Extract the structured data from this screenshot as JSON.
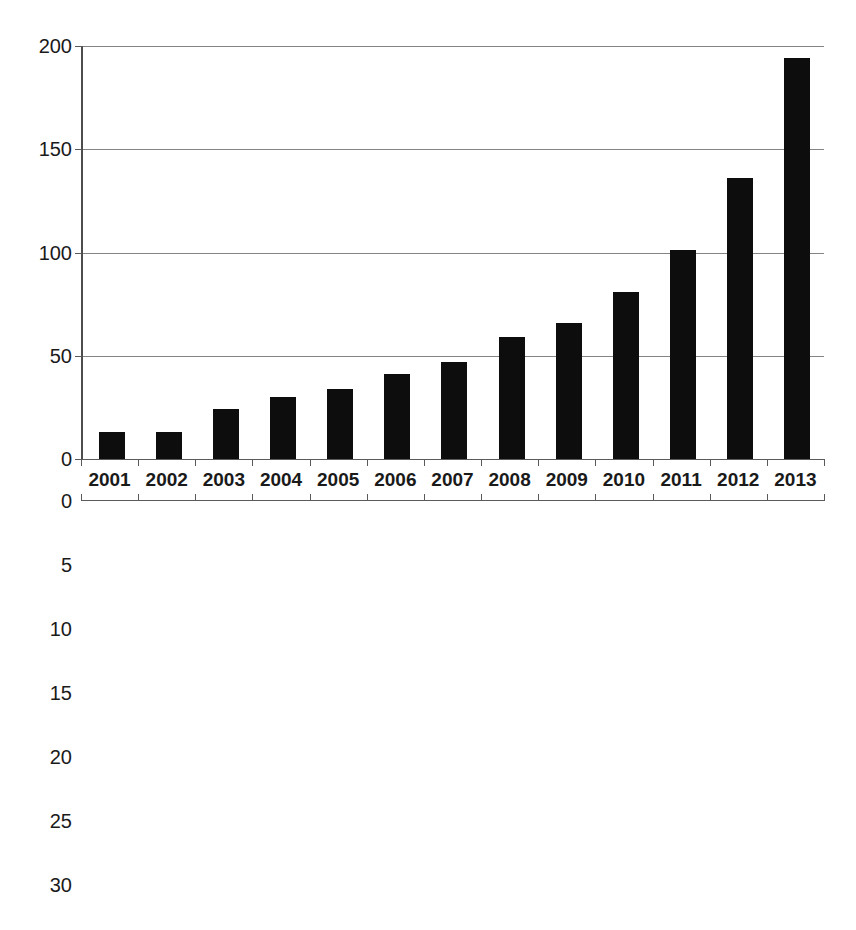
{
  "chart_data": [
    {
      "id": "top",
      "type": "bar",
      "title": "",
      "xlabel": "",
      "ylabel": "",
      "orientation": "up",
      "grid": true,
      "legend": "none",
      "categories": [
        "2001",
        "2002",
        "2003",
        "2004",
        "2005",
        "2006",
        "2007",
        "2008",
        "2009",
        "2010",
        "2011",
        "2012",
        "2013"
      ],
      "values": [
        13,
        13,
        24,
        30,
        34,
        41,
        47,
        59,
        66,
        81,
        101,
        136,
        194
      ],
      "ylim": [
        0,
        200
      ],
      "yticks": [
        0,
        50,
        100,
        150,
        200
      ],
      "ytick_labels": [
        "0",
        "50",
        "100",
        "150",
        "200"
      ],
      "bar_color": "#0d0d0d",
      "series_name": ""
    },
    {
      "id": "bottom",
      "type": "bar",
      "title": "",
      "xlabel": "",
      "ylabel": "",
      "orientation": "down",
      "grid": true,
      "legend": "none",
      "categories": [
        "2001",
        "2002",
        "2003",
        "2004",
        "2005",
        "2006",
        "2007",
        "2008",
        "2009",
        "2010",
        "2011",
        "2012",
        "2013"
      ],
      "values": [
        6,
        6,
        12,
        15,
        16,
        16,
        16,
        18,
        18,
        20,
        22,
        24,
        30
      ],
      "ylim": [
        0,
        30
      ],
      "yticks": [
        0,
        5,
        10,
        15,
        20,
        25,
        30
      ],
      "ytick_labels": [
        "0",
        "5",
        "10",
        "15",
        "20",
        "25",
        "30"
      ],
      "bar_color": "#b9b9b9",
      "series_name": ""
    }
  ],
  "axis": {
    "gridline_color": "#848484",
    "axis_color": "#5a5a5a",
    "background": "#ffffff"
  }
}
